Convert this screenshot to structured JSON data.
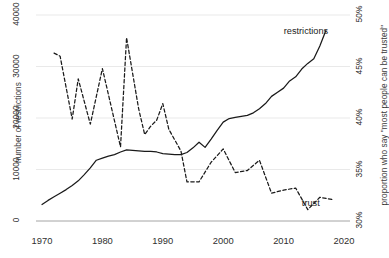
{
  "chart_data": {
    "type": "line",
    "title": "",
    "xlabel": "",
    "ylabel": "number of restrictions",
    "y2label": "proportion who say \"most people can be trusted\"",
    "grid": true,
    "legend_position": "inline-end-labels",
    "xlim": [
      1968,
      2022
    ],
    "xticks": [
      1970,
      1980,
      1990,
      2000,
      2010,
      2020
    ],
    "xticklabels": [
      "1970",
      "1980",
      "1990",
      "2000",
      "2010",
      "2020"
    ],
    "ylim": [
      0,
      40000
    ],
    "yticks": [
      0,
      10000,
      20000,
      30000,
      40000
    ],
    "yticklabels": [
      "0",
      "10000",
      "20000",
      "30000",
      "40000"
    ],
    "y2lim": [
      30,
      50
    ],
    "y2ticks": [
      30,
      35,
      40,
      45,
      50
    ],
    "y2ticklabels": [
      "30%",
      "35%",
      "40%",
      "45%",
      "50%"
    ],
    "series": [
      {
        "name": "restrictions",
        "label": "restrictions",
        "axis": "left",
        "style": "solid",
        "color": "#1a1a1a",
        "x": [
          1970,
          1971,
          1972,
          1973,
          1974,
          1975,
          1976,
          1977,
          1978,
          1979,
          1980,
          1981,
          1982,
          1983,
          1984,
          1985,
          1986,
          1987,
          1988,
          1989,
          1990,
          1991,
          1992,
          1993,
          1994,
          1995,
          1996,
          1997,
          1998,
          1999,
          2000,
          2001,
          2002,
          2003,
          2004,
          2005,
          2006,
          2007,
          2008,
          2009,
          2010,
          2011,
          2012,
          2013,
          2014,
          2015,
          2016,
          2017
        ],
        "values": [
          3200,
          4000,
          4700,
          5400,
          6100,
          6900,
          7800,
          9000,
          10300,
          11800,
          12200,
          12600,
          12900,
          13400,
          13800,
          13700,
          13600,
          13500,
          13500,
          13400,
          13100,
          13000,
          12900,
          12900,
          13300,
          14200,
          15300,
          14300,
          15900,
          17600,
          19200,
          19900,
          20100,
          20300,
          20500,
          21000,
          21800,
          22800,
          24200,
          25000,
          25800,
          27200,
          28000,
          29500,
          30600,
          31500,
          34000,
          37000
        ]
      },
      {
        "name": "trust",
        "label": "trust",
        "axis": "right",
        "style": "dashed",
        "color": "#1a1a1a",
        "x": [
          1972,
          1973,
          1975,
          1976,
          1978,
          1980,
          1983,
          1984,
          1986,
          1987,
          1988,
          1989,
          1990,
          1991,
          1993,
          1994,
          1996,
          1998,
          2000,
          2002,
          2004,
          2006,
          2008,
          2010,
          2012,
          2014,
          2016,
          2018
        ],
        "values": [
          46.3,
          46.0,
          39.9,
          43.8,
          39.4,
          44.8,
          37.2,
          47.8,
          40.9,
          38.4,
          39.2,
          39.8,
          41.4,
          38.9,
          36.8,
          33.8,
          33.8,
          35.7,
          37.0,
          34.7,
          34.9,
          35.9,
          32.7,
          33.0,
          33.2,
          31.1,
          32.3,
          32.1
        ]
      }
    ],
    "annotations": [
      {
        "text": "restrictions",
        "x": 2013,
        "y_px": 26
      },
      {
        "text": "trust",
        "x": 2016,
        "y_px": 198
      }
    ]
  }
}
